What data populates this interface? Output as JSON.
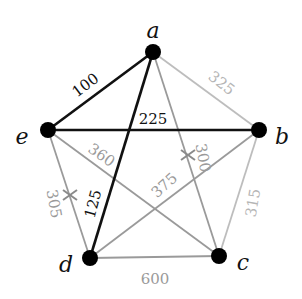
{
  "graph": {
    "nodes": [
      {
        "id": "a",
        "label": "a",
        "x": 153,
        "y": 52,
        "lx": 153,
        "ly": 32
      },
      {
        "id": "b",
        "label": "b",
        "x": 259,
        "y": 130,
        "lx": 282,
        "ly": 138
      },
      {
        "id": "c",
        "label": "c",
        "x": 219,
        "y": 256,
        "lx": 243,
        "ly": 264
      },
      {
        "id": "d",
        "label": "d",
        "x": 90,
        "y": 258,
        "lx": 66,
        "ly": 266
      },
      {
        "id": "e",
        "label": "e",
        "x": 48,
        "y": 130,
        "lx": 22,
        "ly": 138
      }
    ],
    "edges": [
      {
        "from": "a",
        "to": "e",
        "weight": "100",
        "style": "bold",
        "lx": 86,
        "ly": 86,
        "rot": -37
      },
      {
        "from": "a",
        "to": "b",
        "weight": "325",
        "style": "light",
        "lx": 221,
        "ly": 84,
        "rot": 38
      },
      {
        "from": "a",
        "to": "d",
        "weight": "225",
        "style": "bold",
        "lx": 153,
        "ly": 120,
        "rot": 0
      },
      {
        "from": "a",
        "to": "c",
        "weight": "300",
        "style": "mid",
        "lx": 202,
        "ly": 158,
        "rot": 80
      },
      {
        "from": "e",
        "to": "b",
        "weight": "",
        "style": "bold"
      },
      {
        "from": "e",
        "to": "c",
        "weight": "360",
        "style": "mid",
        "lx": 101,
        "ly": 156,
        "rot": 35
      },
      {
        "from": "e",
        "to": "d",
        "weight": "305",
        "style": "mid",
        "lx": 53,
        "ly": 204,
        "rot": 80
      },
      {
        "from": "d",
        "to": "b",
        "weight": "375",
        "style": "mid",
        "lx": 165,
        "ly": 186,
        "rot": -42
      },
      {
        "from": "d",
        "to": "c",
        "weight": "600",
        "style": "mid",
        "lx": 155,
        "ly": 280,
        "rot": 0
      },
      {
        "from": "b",
        "to": "c",
        "weight": "315",
        "style": "light",
        "lx": 254,
        "ly": 203,
        "rot": -80
      },
      {
        "from": "d",
        "to": "a",
        "weight": "125",
        "style": "bold",
        "lx": 94,
        "ly": 204,
        "rot": -75,
        "skipLine": true
      }
    ],
    "crosses": [
      {
        "x": 188,
        "y": 155
      },
      {
        "x": 70,
        "y": 195
      }
    ],
    "colors": {
      "bold": "#111111",
      "mid": "#9a9a9a",
      "light": "#bdbdbd",
      "node": "#000000"
    }
  }
}
